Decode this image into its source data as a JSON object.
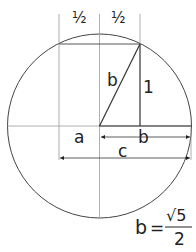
{
  "diagram": {
    "labels": {
      "half_left": "½",
      "half_right": "½",
      "hyp": "b",
      "side": "1",
      "a": "a",
      "b": "b",
      "c": "c"
    },
    "formula": {
      "lhs": "b",
      "eq": "=",
      "num": "√5",
      "den": "2"
    },
    "colors": {
      "stroke": "#333333",
      "thin": "#888888"
    }
  }
}
